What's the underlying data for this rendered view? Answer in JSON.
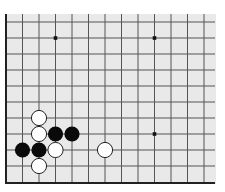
{
  "board": {
    "name": "go-board-fragment",
    "background": "#e9e9e9",
    "line_color": "#555555",
    "edge_color": "#222222",
    "area": {
      "x": 6,
      "y": 14,
      "width": 210,
      "height": 170
    },
    "columns_x": [
      6,
      22.5,
      39,
      55.5,
      72,
      88.5,
      105,
      121.5,
      138,
      154.5,
      171,
      187.5,
      204
    ],
    "rows_y": [
      22,
      38,
      54,
      70,
      86,
      102,
      118,
      134,
      150,
      166,
      183
    ],
    "edges": {
      "left": true,
      "bottom": true,
      "top": false,
      "right": false
    },
    "star_points": [
      {
        "col": 3,
        "row": 1
      },
      {
        "col": 9,
        "row": 1
      },
      {
        "col": 9,
        "row": 7
      }
    ],
    "stones": [
      {
        "color": "white",
        "col": 2,
        "row": 6
      },
      {
        "color": "white",
        "col": 2,
        "row": 7
      },
      {
        "color": "black",
        "col": 3,
        "row": 7
      },
      {
        "color": "black",
        "col": 4,
        "row": 7
      },
      {
        "color": "black",
        "col": 1,
        "row": 8
      },
      {
        "color": "black",
        "col": 2,
        "row": 8
      },
      {
        "color": "white",
        "col": 3,
        "row": 8
      },
      {
        "color": "white",
        "col": 6,
        "row": 8
      },
      {
        "color": "white",
        "col": 2,
        "row": 9
      }
    ],
    "stone_radius": 7.6,
    "colors": {
      "black_stone": "#0a0a0a",
      "white_stone": "#ffffff",
      "white_stone_outline": "#222222"
    }
  }
}
